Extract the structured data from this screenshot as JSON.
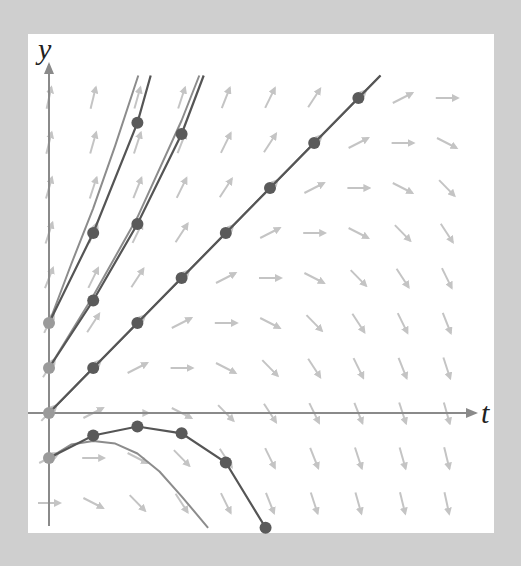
{
  "labels": {
    "x_axis": "t",
    "y_axis": "y"
  },
  "colors": {
    "background": "#cfcfcf",
    "panel": "#ffffff",
    "axis": "#8a8a8a",
    "slope_arrow": "#c4c4c4",
    "euler_line": "#555555",
    "euler_point": "#5a5a5a",
    "initial_point": "#9a9a9a",
    "exact_curve": "#8c8c8c"
  },
  "chart_data": {
    "type": "slope-field",
    "title": "",
    "xlabel": "t",
    "ylabel": "y",
    "xlim": [
      0,
      9.7
    ],
    "ylim": [
      -2.7,
      7.7
    ],
    "grid": false,
    "ode": "dy/dt = (y - t + 2) / 2",
    "step_size": 1,
    "slope_field_grid": {
      "t": [
        0,
        1,
        2,
        3,
        4,
        5,
        6,
        7,
        8,
        9
      ],
      "y": [
        -2,
        -1,
        0,
        1,
        2,
        3,
        4,
        5,
        6,
        7
      ]
    },
    "euler_sequences": [
      {
        "name": "y0=2",
        "points": [
          [
            0,
            2
          ],
          [
            1,
            4
          ],
          [
            2,
            6.45
          ]
        ],
        "extends_to": [
          2.3,
          7.5
        ]
      },
      {
        "name": "y0=1",
        "points": [
          [
            0,
            1
          ],
          [
            1,
            2.5
          ],
          [
            2,
            4.2
          ],
          [
            3,
            6.2
          ]
        ],
        "extends_to": [
          3.5,
          7.5
        ]
      },
      {
        "name": "y0=0",
        "points": [
          [
            0,
            0
          ],
          [
            1,
            1
          ],
          [
            2,
            2
          ],
          [
            3,
            3
          ],
          [
            4,
            4
          ],
          [
            5,
            5
          ],
          [
            6,
            6
          ],
          [
            7,
            7
          ]
        ],
        "extends_to": [
          7.5,
          7.5
        ]
      },
      {
        "name": "y0=-1",
        "points": [
          [
            0,
            -1
          ],
          [
            1,
            -0.5
          ],
          [
            2,
            -0.3
          ],
          [
            3,
            -0.45
          ],
          [
            4,
            -1.1
          ],
          [
            4.9,
            -2.55
          ]
        ]
      }
    ],
    "exact_solutions": [
      {
        "name": "y0=2",
        "points": [
          [
            0,
            2
          ],
          [
            0.5,
            3.3
          ],
          [
            1,
            4.55
          ],
          [
            1.5,
            5.95
          ],
          [
            2.02,
            7.5
          ]
        ]
      },
      {
        "name": "y0=1",
        "points": [
          [
            0,
            1
          ],
          [
            1,
            2.6
          ],
          [
            2,
            4.35
          ],
          [
            3,
            6.5
          ],
          [
            3.4,
            7.5
          ]
        ]
      },
      {
        "name": "y0=0",
        "points": [
          [
            0,
            0
          ],
          [
            7.5,
            7.5
          ]
        ]
      },
      {
        "name": "y0=-1",
        "points": [
          [
            0,
            -1
          ],
          [
            0.5,
            -0.7
          ],
          [
            1,
            -0.62
          ],
          [
            1.5,
            -0.68
          ],
          [
            2,
            -0.9
          ],
          [
            2.5,
            -1.3
          ],
          [
            3,
            -1.85
          ],
          [
            3.6,
            -2.55
          ]
        ]
      }
    ]
  }
}
